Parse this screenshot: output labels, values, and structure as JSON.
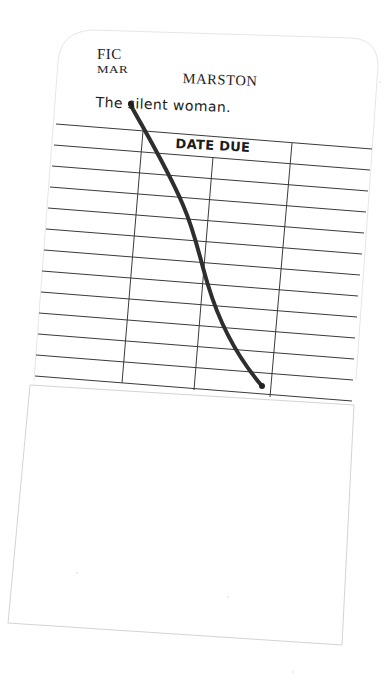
{
  "card": {
    "call_number_line1": "FIC",
    "call_number_line2": "MAR",
    "author": "MARSTON",
    "title": "The silent woman.",
    "date_due_header": "DATE DUE",
    "ruled_rows": 13,
    "columns": 4
  },
  "colors": {
    "paper": "#ffffff",
    "rule_line": "#3a3a3a",
    "card_edge": "#d8d8d8",
    "ink_stroke": "#2e2e2e"
  },
  "annotations": {
    "strike_through": "hand-drawn diagonal ink line crossing the card"
  }
}
